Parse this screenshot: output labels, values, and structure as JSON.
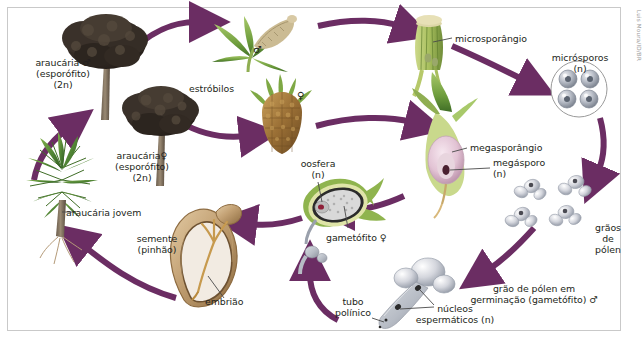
{
  "figure": {
    "credit": "Luis Moura/ID/BR",
    "border_color": "#c9c9c9",
    "background": "#ffffff",
    "arrow_color": "#6b2d63",
    "label_color": "#231f20"
  },
  "labels": {
    "araucaria_male": "araucária ♂\n(esporófito)\n(2n)",
    "araucaria_female": "araucária♀\n(esporófito)\n(2n)",
    "araucaria_jovem": "araucária jovem",
    "estrobilos": "estróbilos",
    "estrobilo_male_symbol": "♂",
    "estrobilo_female_symbol": "♀",
    "microsporangio": "microsporângio",
    "microsporos": "micrósporos\n(n)",
    "megasporangio": "megasporângio",
    "megasporo": "megásporo\n(n)",
    "oosfera": "oosfera\n(n)",
    "gametofito_female": "gametófito ♀",
    "graos_de_polen": "grãos\nde\npólen",
    "grao_polen_germinacao": "grão de pólen em\ngerminação (gametófito) ♂",
    "tubo_polinico": "tubo\npolínico",
    "nucleos_espermaticos": "núcleos\nespermáticos (n)",
    "semente": "semente\n(pinhão)",
    "embriao": "embrião"
  },
  "cycle_stages": [
    {
      "id": "araucaria-jovem",
      "label": "araucária jovem",
      "ploidy": "2n"
    },
    {
      "id": "araucaria-male",
      "label": "araucária ♂ (esporófito)",
      "ploidy": "2n"
    },
    {
      "id": "araucaria-female",
      "label": "araucária♀ (esporófito)",
      "ploidy": "2n"
    },
    {
      "id": "estrobilo-male",
      "label": "estróbilos ♂",
      "ploidy": "2n"
    },
    {
      "id": "estrobilo-female",
      "label": "estróbilos ♀",
      "ploidy": "2n"
    },
    {
      "id": "microsporangio",
      "label": "microsporângio",
      "ploidy": "2n"
    },
    {
      "id": "microsporos",
      "label": "micrósporos",
      "ploidy": "n"
    },
    {
      "id": "megasporangio",
      "label": "megasporângio",
      "ploidy": "2n"
    },
    {
      "id": "megasporo",
      "label": "megásporo",
      "ploidy": "n"
    },
    {
      "id": "graos-de-polen",
      "label": "grãos de pólen",
      "ploidy": "n"
    },
    {
      "id": "grao-polen-germinacao",
      "label": "grão de pólen em germinação (gametófito) ♂",
      "ploidy": "n"
    },
    {
      "id": "gametofito-female",
      "label": "gametófito ♀",
      "ploidy": "n"
    },
    {
      "id": "oosfera",
      "label": "oosfera",
      "ploidy": "n"
    },
    {
      "id": "semente",
      "label": "semente (pinhão)",
      "ploidy": "2n"
    },
    {
      "id": "embriao",
      "label": "embrião",
      "ploidy": "2n"
    }
  ]
}
